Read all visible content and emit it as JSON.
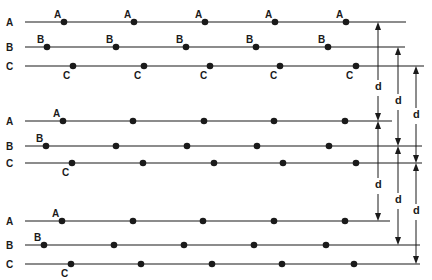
{
  "diagram": {
    "colors": {
      "ink": "#1a1a1a",
      "background": "#ffffff"
    },
    "groups": [
      {
        "rows": [
          {
            "label": "A",
            "y": 22,
            "x_start": 25,
            "x_end": 406,
            "dots": [
              64,
              134,
              205,
              275,
              346
            ],
            "dot_labels": [
              "A",
              "A",
              "A",
              "A",
              "A"
            ],
            "label_pos": "above"
          },
          {
            "label": "B",
            "y": 47,
            "x_start": 25,
            "x_end": 405,
            "dots": [
              47,
              116,
              186,
              256,
              328
            ],
            "dot_labels": [
              "B",
              "B",
              "B",
              "B",
              "B"
            ],
            "label_pos": "above"
          },
          {
            "label": "C",
            "y": 66,
            "x_start": 25,
            "x_end": 424,
            "dots": [
              73,
              144,
              210,
              280,
              356
            ],
            "dot_labels": [
              "C",
              "C",
              "C",
              "C",
              "C"
            ],
            "label_pos": "below"
          }
        ]
      },
      {
        "rows": [
          {
            "label": "A",
            "y": 121,
            "x_start": 25,
            "x_end": 392,
            "dots": [
              63,
              133,
              204,
              274,
              345
            ],
            "dot_labels": [
              "A"
            ],
            "label_pos": "above"
          },
          {
            "label": "B",
            "y": 146,
            "x_start": 25,
            "x_end": 422,
            "dots": [
              46,
              116,
              187,
              257,
              329
            ],
            "dot_labels": [
              "B"
            ],
            "label_pos": "above"
          },
          {
            "label": "C",
            "y": 163,
            "x_start": 25,
            "x_end": 422,
            "dots": [
              72,
              143,
              214,
              283,
              356
            ],
            "dot_labels": [
              "C"
            ],
            "label_pos": "below"
          }
        ]
      },
      {
        "rows": [
          {
            "label": "A",
            "y": 221,
            "x_start": 25,
            "x_end": 390,
            "dots": [
              62,
              133,
              203,
              274,
              345
            ],
            "dot_labels": [
              "A"
            ],
            "label_pos": "above"
          },
          {
            "label": "B",
            "y": 245,
            "x_start": 25,
            "x_end": 420,
            "dots": [
              44,
              114,
              184,
              254,
              326
            ],
            "dot_labels": [
              "B"
            ],
            "label_pos": "above"
          },
          {
            "label": "C",
            "y": 264,
            "x_start": 25,
            "x_end": 420,
            "dots": [
              71,
              141,
              212,
              282,
              354
            ],
            "dot_labels": [
              "C"
            ],
            "label_pos": "below"
          }
        ]
      }
    ],
    "spacing_arrows": [
      {
        "x": 378,
        "segments": [
          {
            "from": 22,
            "to": 121,
            "label": "d",
            "label_y": 90
          },
          {
            "from": 121,
            "to": 221,
            "label": "d",
            "label_y": 188
          }
        ]
      },
      {
        "x": 398,
        "segments": [
          {
            "from": 47,
            "to": 146,
            "label": "d",
            "label_y": 104
          },
          {
            "from": 146,
            "to": 245,
            "label": "d",
            "label_y": 203
          }
        ]
      },
      {
        "x": 416,
        "segments": [
          {
            "from": 66,
            "to": 163,
            "label": "d",
            "label_y": 118
          },
          {
            "from": 163,
            "to": 264,
            "label": "d",
            "label_y": 214
          }
        ]
      }
    ],
    "spacing_label": "d"
  }
}
